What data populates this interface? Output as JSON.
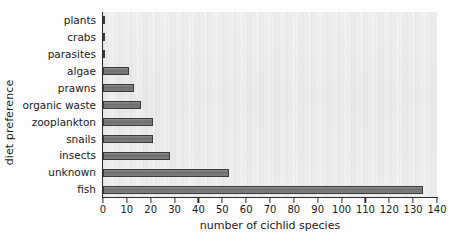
{
  "chart_data": {
    "type": "bar",
    "orientation": "horizontal",
    "title": "",
    "xlabel": "number of cichlid species",
    "ylabel": "diet preference",
    "categories": [
      "plants",
      "crabs",
      "parasites",
      "algae",
      "prawns",
      "organic waste",
      "zooplankton",
      "snails",
      "insects",
      "unknown",
      "fish"
    ],
    "values": [
      1,
      1,
      1,
      11,
      13,
      16,
      21,
      21,
      28,
      53,
      134
    ],
    "xlim": [
      0,
      140
    ],
    "xticks": [
      0,
      10,
      20,
      30,
      40,
      50,
      60,
      70,
      80,
      90,
      100,
      110,
      120,
      130,
      140
    ],
    "xtick_labels": [
      "0",
      "10",
      "20",
      "30",
      "40",
      "50",
      "60",
      "70",
      "80",
      "90",
      "100",
      "110",
      "120",
      "130",
      "140"
    ],
    "grid": false,
    "legend": null,
    "bar_color": "#7a7a7a",
    "bar_edge_color": "#3a3a3a",
    "plot_background": "#efefef"
  }
}
